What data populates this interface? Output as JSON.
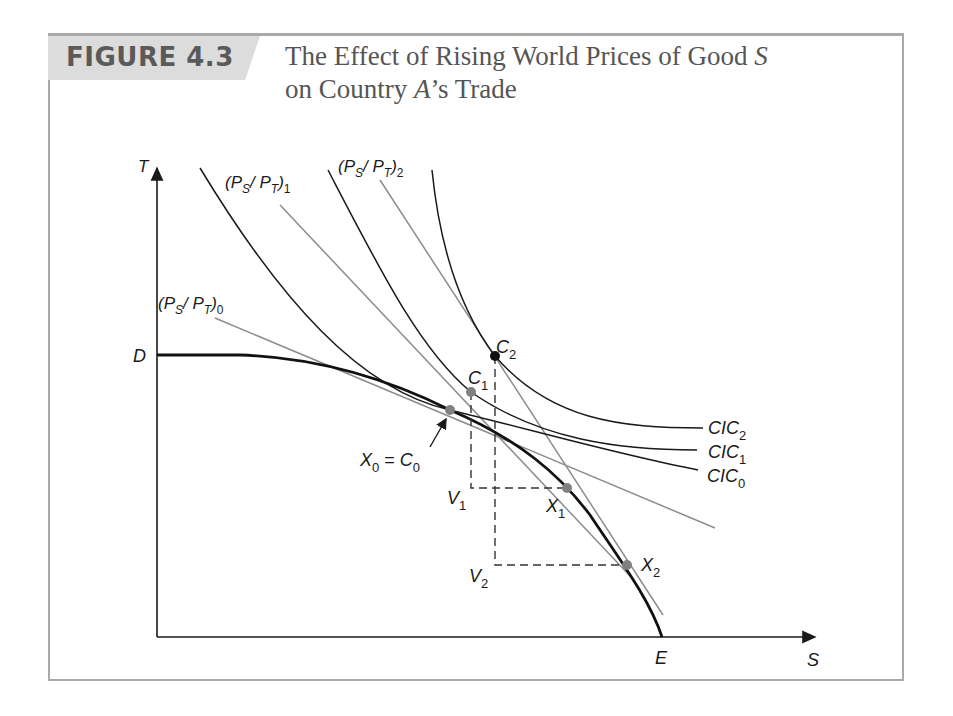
{
  "figure": {
    "label": "FIGURE 4.3",
    "title_line1_prefix": "The Effect of Rising World Prices of Good ",
    "title_line1_var": "S",
    "title_line2_prefix": "on Country ",
    "title_line2_var": "A",
    "title_line2_suffix": "’s Trade"
  },
  "axes": {
    "y_label": "T",
    "x_label": "S",
    "y_intercept_label": "D",
    "x_intercept_label": "E"
  },
  "price_lines": [
    {
      "label": "(P_S/P_T)_0",
      "base": "(P",
      "sub1": "S",
      "mid": "/ P",
      "sub2": "T",
      "end": ")",
      "index": "0"
    },
    {
      "label": "(P_S/P_T)_1",
      "base": "(P",
      "sub1": "S",
      "mid": "/ P",
      "sub2": "T",
      "end": ")",
      "index": "1"
    },
    {
      "label": "(P_S/P_T)_2",
      "base": "(P",
      "sub1": "S",
      "mid": "/ P",
      "sub2": "T",
      "end": ")",
      "index": "2"
    }
  ],
  "indifference_curves": [
    {
      "label": "CIC0",
      "base": "CIC",
      "index": "0"
    },
    {
      "label": "CIC1",
      "base": "CIC",
      "index": "1"
    },
    {
      "label": "CIC2",
      "base": "CIC",
      "index": "2"
    }
  ],
  "points": {
    "x0_c0": {
      "base1": "X",
      "sub1": "0",
      "eq": " = ",
      "base2": "C",
      "sub2": "0"
    },
    "c1": {
      "base": "C",
      "sub": "1"
    },
    "c2": {
      "base": "C",
      "sub": "2"
    },
    "x1": {
      "base": "X",
      "sub": "1"
    },
    "x2": {
      "base": "X",
      "sub": "2"
    },
    "v1": {
      "base": "V",
      "sub": "1"
    },
    "v2": {
      "base": "V",
      "sub": "2"
    }
  },
  "colors": {
    "curve": "#1a1a1a",
    "price_line": "#8c8c8c",
    "point_grey": "#808080",
    "point_black": "#111111",
    "frame": "#a9a9a9",
    "label_bg": "#dcdcdc"
  }
}
